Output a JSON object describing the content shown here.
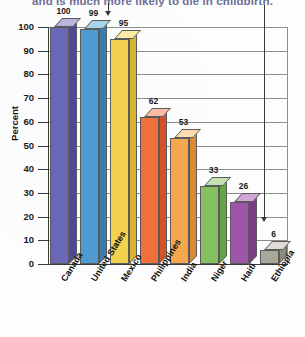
{
  "chart_data": {
    "type": "bar",
    "title": "and is much more likely to die in childbirth.",
    "xlabel": "",
    "ylabel": "Percent",
    "ylim": [
      0,
      100
    ],
    "ytick_labels": [
      "100",
      "90",
      "80",
      "70",
      "60",
      "50",
      "40",
      "30",
      "20",
      "10",
      "0"
    ],
    "ytick_values": [
      100,
      90,
      80,
      70,
      60,
      50,
      40,
      30,
      20,
      10,
      0
    ],
    "grid": true,
    "legend": "none",
    "categories": [
      "Canada",
      "United States",
      "Mexico",
      "Philippines",
      "India",
      "Niger",
      "Haiti",
      "Ethiopia"
    ],
    "values": [
      100,
      99,
      95,
      62,
      53,
      33,
      26,
      6
    ],
    "value_labels": [
      "100",
      "99",
      "95",
      "62",
      "53",
      "33",
      "26",
      "6"
    ],
    "bar_colors": [
      "#6b68b8",
      "#4f9bd0",
      "#f2d250",
      "#f0703c",
      "#f5a74e",
      "#86c061",
      "#9c55a8",
      "#a8a79a"
    ],
    "bar_top_colors": [
      "#b8b6de",
      "#a9d3ea",
      "#faeaa8",
      "#f8bfa6",
      "#fbdcb3",
      "#c6e3b4",
      "#cfa6d6",
      "#dedcd2"
    ],
    "bar_side_colors": [
      "#4e4b96",
      "#3b7cae",
      "#d9b42e",
      "#d4542a",
      "#d98a33",
      "#66a246",
      "#7c3c89",
      "#8c8b7e"
    ],
    "annotations": [
      {
        "name": "arrow-to-united-states",
        "label": "",
        "points_to": "United States"
      },
      {
        "name": "arrow-to-ethiopia",
        "label": "",
        "points_to": "Ethiopia"
      }
    ]
  }
}
